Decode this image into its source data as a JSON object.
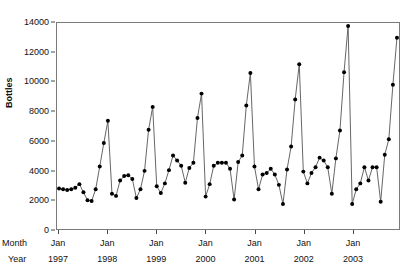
{
  "chart_data": {
    "type": "line",
    "title": "",
    "xlabel": "",
    "ylabel": "Bottles",
    "ylim": [
      0,
      14000
    ],
    "ytick_values": [
      0,
      2000,
      4000,
      6000,
      8000,
      10000,
      12000,
      14000
    ],
    "ytick_labels": [
      "0",
      "2000",
      "4000",
      "6000",
      "8000",
      "10000",
      "12000",
      "14000"
    ],
    "grid": false,
    "legend": false,
    "row_headers": [
      "Month",
      "Year"
    ],
    "xtick_month_labels": [
      "Jan",
      "Jan",
      "Jan",
      "Jan",
      "Jan",
      "Jan",
      "Jan"
    ],
    "xtick_year_labels": [
      "1997",
      "1998",
      "1999",
      "2000",
      "2001",
      "2002",
      "2003"
    ],
    "marker": "filled-circle",
    "line_color": "#555555",
    "marker_color": "#000000",
    "x": [
      "Jan 1997",
      "Feb 1997",
      "Mar 1997",
      "Apr 1997",
      "May 1997",
      "Jun 1997",
      "Jul 1997",
      "Aug 1997",
      "Sep 1997",
      "Oct 1997",
      "Nov 1997",
      "Dec 1997",
      "Jan 1998",
      "Feb 1998",
      "Mar 1998",
      "Apr 1998",
      "May 1998",
      "Jun 1998",
      "Jul 1998",
      "Aug 1998",
      "Sep 1998",
      "Oct 1998",
      "Nov 1998",
      "Dec 1998",
      "Jan 1999",
      "Feb 1999",
      "Mar 1999",
      "Apr 1999",
      "May 1999",
      "Jun 1999",
      "Jul 1999",
      "Aug 1999",
      "Sep 1999",
      "Oct 1999",
      "Nov 1999",
      "Dec 1999",
      "Jan 2000",
      "Feb 2000",
      "Mar 2000",
      "Apr 2000",
      "May 2000",
      "Jun 2000",
      "Jul 2000",
      "Aug 2000",
      "Sep 2000",
      "Oct 2000",
      "Nov 2000",
      "Dec 2000",
      "Jan 2001",
      "Feb 2001",
      "Mar 2001",
      "Apr 2001",
      "May 2001",
      "Jun 2001",
      "Jul 2001",
      "Aug 2001",
      "Sep 2001",
      "Oct 2001",
      "Nov 2001",
      "Dec 2001",
      "Jan 2002",
      "Feb 2002",
      "Mar 2002",
      "Apr 2002",
      "May 2002",
      "Jun 2002",
      "Jul 2002",
      "Aug 2002",
      "Sep 2002",
      "Oct 2002",
      "Nov 2002",
      "Dec 2002",
      "Jan 2003",
      "Feb 2003",
      "Mar 2003",
      "Apr 2003",
      "May 2003",
      "Jun 2003",
      "Jul 2003",
      "Aug 2003",
      "Sep 2003",
      "Oct 2003",
      "Nov 2003",
      "Dec 2003"
    ],
    "values": [
      2750,
      2700,
      2650,
      2700,
      2800,
      3050,
      2500,
      1950,
      1900,
      2700,
      4250,
      5850,
      7350,
      2400,
      2250,
      3300,
      3600,
      3650,
      3400,
      2100,
      2700,
      3950,
      6750,
      8300,
      2900,
      2450,
      3100,
      4000,
      5000,
      4650,
      4300,
      3150,
      4150,
      4500,
      7550,
      9200,
      2200,
      3050,
      4300,
      4500,
      4500,
      4500,
      4100,
      2000,
      4550,
      5000,
      8400,
      10600,
      4250,
      2700,
      3700,
      3800,
      4100,
      3700,
      3000,
      1700,
      4050,
      5600,
      8800,
      11200,
      3900,
      3100,
      3800,
      4200,
      4850,
      4650,
      4200,
      2400,
      4800,
      6700,
      10650,
      13800,
      1700,
      2700,
      3100,
      4200,
      3300,
      4200,
      4200,
      1850,
      5050,
      6100,
      9800,
      13000
    ]
  }
}
